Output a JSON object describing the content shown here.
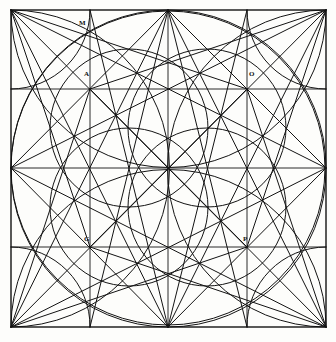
{
  "figure": {
    "background_color": "#fdfdfb",
    "stroke_color": "#131313",
    "stroke_width": 1.0,
    "square": {
      "left": 11,
      "top": 10,
      "right": 326,
      "bottom": 327,
      "width": 315,
      "height": 317
    },
    "grid": {
      "vertical_lines_x": [
        11,
        90,
        168,
        247,
        326
      ],
      "horizontal_lines_y": [
        10,
        89,
        168,
        247,
        327
      ],
      "divisions": 4
    },
    "labels": [
      {
        "text": "M",
        "x": 79,
        "y": 20,
        "point_x": 90,
        "point_y": 10
      },
      {
        "text": "A",
        "x": 84,
        "y": 71,
        "point_x": 90,
        "point_y": 89
      },
      {
        "text": "O",
        "x": 249,
        "y": 71,
        "point_x": 247,
        "point_y": 89
      },
      {
        "text": "G",
        "x": 84,
        "y": 236,
        "point_x": 90,
        "point_y": 247
      },
      {
        "text": "P",
        "x": 243,
        "y": 236,
        "point_x": 247,
        "point_y": 247
      }
    ],
    "circles": [
      {
        "name": "great-inscribed-circle",
        "cx": 168,
        "cy": 168,
        "r": 157
      },
      {
        "name": "inner-circle-upper-left",
        "cx": 129,
        "cy": 128,
        "r": 79
      },
      {
        "name": "inner-circle-upper-right",
        "cx": 207,
        "cy": 128,
        "r": 79
      },
      {
        "name": "inner-circle-lower-left",
        "cx": 129,
        "cy": 207,
        "r": 79
      },
      {
        "name": "inner-circle-lower-right",
        "cx": 207,
        "cy": 207,
        "r": 79
      }
    ],
    "arc_radius_quarter": 157,
    "arc_radius_half": 79,
    "diagonal_count": 24,
    "point_names": [
      "M",
      "A",
      "O",
      "G",
      "P"
    ]
  }
}
